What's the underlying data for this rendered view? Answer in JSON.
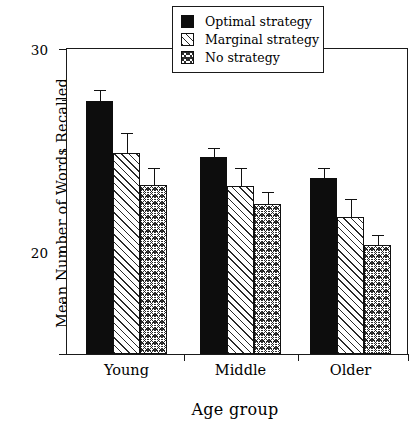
{
  "chart_data": {
    "type": "bar",
    "title": "",
    "xlabel": "Age group",
    "ylabel": "Mean Number of Words Recalled",
    "categories": [
      "Young",
      "Middle",
      "Older"
    ],
    "ylim": [
      0,
      30
    ],
    "yticks": [
      0,
      10,
      20,
      30
    ],
    "ytick_labels": [
      "0",
      "10",
      "20",
      "30"
    ],
    "yminor_ticks": [
      5,
      15,
      25
    ],
    "grid": false,
    "legend_position": "top-center",
    "series": [
      {
        "name": "Optimal strategy",
        "pattern": "solid-black",
        "values": [
          24.9,
          19.4,
          17.3
        ],
        "errors": [
          1.1,
          0.9,
          1.0
        ]
      },
      {
        "name": "Marginal strategy",
        "pattern": "diagonal-hatch",
        "values": [
          19.8,
          16.5,
          13.5
        ],
        "errors": [
          1.9,
          1.8,
          1.7
        ]
      },
      {
        "name": "No strategy",
        "pattern": "cross-hatch-dotted",
        "values": [
          16.6,
          14.8,
          10.7
        ],
        "errors": [
          1.7,
          1.1,
          1.0
        ]
      }
    ]
  },
  "axes": {
    "y_title": "Mean Number of Words Recalled",
    "x_title": "Age group",
    "y_tick_0": "0",
    "y_tick_1": "10",
    "y_tick_2": "20",
    "y_tick_3": "30",
    "x_tick_0": "Young",
    "x_tick_1": "Middle",
    "x_tick_2": "Older"
  },
  "legend": {
    "items": [
      {
        "label": "Optimal strategy",
        "swatch": "solid-black-swatch"
      },
      {
        "label": "Marginal strategy",
        "swatch": "diagonal-hatch-swatch"
      },
      {
        "label": "No strategy",
        "swatch": "cross-hatch-swatch"
      }
    ]
  }
}
